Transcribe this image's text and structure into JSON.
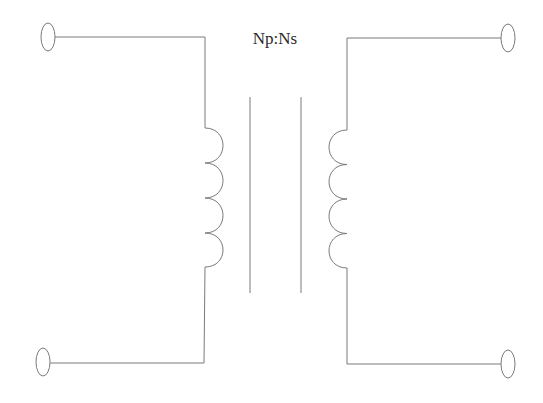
{
  "diagram": {
    "ratio_label": "Np:Ns",
    "colors": {
      "stroke": "#7a7a7a",
      "text": "#2a2a2a",
      "background": "#ffffff"
    },
    "primary": {
      "name": "primary-winding",
      "turns": 4,
      "terminals": [
        {
          "name": "primary-top-terminal",
          "cx": 48,
          "cy": 37
        },
        {
          "name": "primary-bottom-terminal",
          "cx": 43,
          "cy": 362
        }
      ]
    },
    "secondary": {
      "name": "secondary-winding",
      "turns": 4,
      "terminals": [
        {
          "name": "secondary-top-terminal",
          "cx": 508,
          "cy": 38
        },
        {
          "name": "secondary-bottom-terminal",
          "cx": 508,
          "cy": 364
        }
      ]
    },
    "core": {
      "lines": 2,
      "x": [
        250,
        301
      ],
      "y_top": 97,
      "y_bottom": 293
    }
  }
}
